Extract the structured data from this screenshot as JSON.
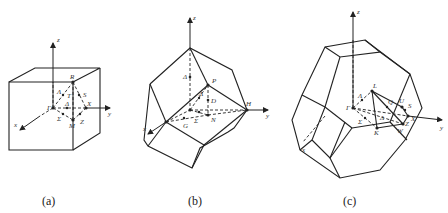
{
  "figures": [
    {
      "id": "a",
      "caption": "(a)",
      "shape": "simple cubic Brillouin zone (cube)",
      "axes": {
        "x": "x",
        "y": "y",
        "z": "z"
      },
      "points": {
        "R": "R",
        "Gamma": "Γ",
        "X": "X",
        "M": "M",
        "Lambda": "Λ",
        "T": "T",
        "S": "S",
        "Delta": "Δ",
        "Sigma": "Σ",
        "Z": "Z"
      }
    },
    {
      "id": "b",
      "caption": "(b)",
      "shape": "body-centered cubic Brillouin zone (rhombic dodecahedron)",
      "axes": {
        "x": "x",
        "y": "y",
        "z": "z"
      },
      "points": {
        "P": "P",
        "H": "H",
        "N": "N",
        "G": "G",
        "Delta": "Δ",
        "Lambda": "Λ",
        "D": "D",
        "Sigma": "Σ",
        "Gamma": "Γ"
      }
    },
    {
      "id": "c",
      "caption": "(c)",
      "shape": "face-centered cubic Brillouin zone (truncated octahedron)",
      "axes": {
        "x": "x",
        "y": "y",
        "z": "z"
      },
      "points": {
        "L": "L",
        "Gamma": "Γ",
        "Lambda": "Λ",
        "Q": "Q",
        "U": "U",
        "S": "S",
        "Sigma": "Σ",
        "Delta": "Δ",
        "K": "K",
        "W": "W",
        "Z": "Z",
        "X": "X"
      }
    }
  ]
}
